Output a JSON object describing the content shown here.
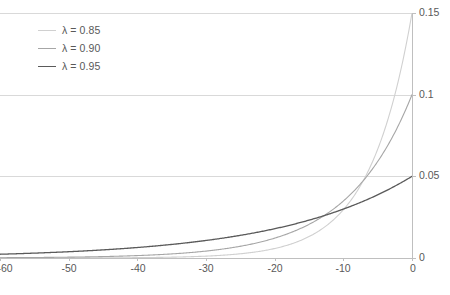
{
  "chart_data": {
    "type": "line",
    "title": "",
    "subtitle": "",
    "xlabel": "",
    "ylabel": "",
    "xlim": [
      -60,
      0
    ],
    "ylim": [
      0,
      0.15
    ],
    "grid": true,
    "grid_axis": "y",
    "y_axis_position": "right",
    "legend_position": "top-left",
    "x_ticks": [
      -60,
      -50,
      -40,
      -30,
      -20,
      -10,
      0
    ],
    "x_tick_labels": [
      "-60",
      "-50",
      "-40",
      "-30",
      "-20",
      "-10",
      "0"
    ],
    "y_ticks": [
      0,
      0.05,
      0.1,
      0.15
    ],
    "y_tick_labels": [
      "0",
      "0.05",
      "0.1",
      "0.15"
    ],
    "series": [
      {
        "name": "λ = 0.85",
        "lambda": 0.85,
        "color": "#d0d0d0",
        "width": 1.1,
        "endpoint_value": 0.15,
        "x": [
          -60,
          -55,
          -50,
          -45,
          -40,
          -35,
          -30,
          -25,
          -20,
          -18,
          -16,
          -14,
          -12,
          -10,
          -8,
          -6,
          -4,
          -2,
          0
        ],
        "values": [
          9e-08,
          4.1e-07,
          1.9e-06,
          8.5e-06,
          3.89e-05,
          0.0001777,
          0.000812,
          0.003711,
          0.016958,
          0.024883,
          0.036511,
          0.053572,
          0.078605,
          0.115332,
          0.169218,
          0.248295,
          0.364355,
          0.534659,
          0.15
        ]
      },
      {
        "name": "λ = 0.90",
        "lambda": 0.9,
        "color": "#a6a6a6",
        "width": 1.1,
        "endpoint_value": 0.1,
        "x": [
          -60,
          -55,
          -50,
          -45,
          -40,
          -35,
          -30,
          -25,
          -20,
          -15,
          -12,
          -10,
          -8,
          -6,
          -4,
          -2,
          0
        ],
        "values": [
          0.000179,
          0.000306,
          0.000515,
          0.000877,
          0.001478,
          0.002505,
          0.004239,
          0.007178,
          0.012158,
          0.020589,
          0.028243,
          0.034868,
          0.043047,
          0.053144,
          0.06561,
          0.081,
          0.1
        ]
      },
      {
        "name": "λ = 0.95",
        "lambda": 0.95,
        "color": "#5a5a5a",
        "width": 1.3,
        "endpoint_value": 0.05,
        "x": [
          -60,
          -55,
          -50,
          -45,
          -40,
          -35,
          -30,
          -25,
          -20,
          -15,
          -12,
          -10,
          -8,
          -6,
          -4,
          -2,
          0
        ],
        "values": [
          0.002291,
          0.002959,
          0.003821,
          0.004935,
          0.006373,
          0.00823,
          0.010628,
          0.013725,
          0.017724,
          0.022888,
          0.02665,
          0.029536,
          0.032735,
          0.03628,
          0.040206,
          0.044556,
          0.05
        ]
      }
    ]
  },
  "legend": {
    "items": [
      {
        "label": "λ = 0.85",
        "color": "#d0d0d0",
        "width": 1
      },
      {
        "label": "λ = 0.90",
        "color": "#a6a6a6",
        "width": 1
      },
      {
        "label": "λ = 0.95",
        "color": "#5a5a5a",
        "width": 1.6
      }
    ]
  },
  "caption": {
    "sliver_text": ""
  },
  "colors": {
    "gridline": "#d9d9d9",
    "axis": "#bfbfbf",
    "text": "#595959",
    "background": "#ffffff"
  }
}
